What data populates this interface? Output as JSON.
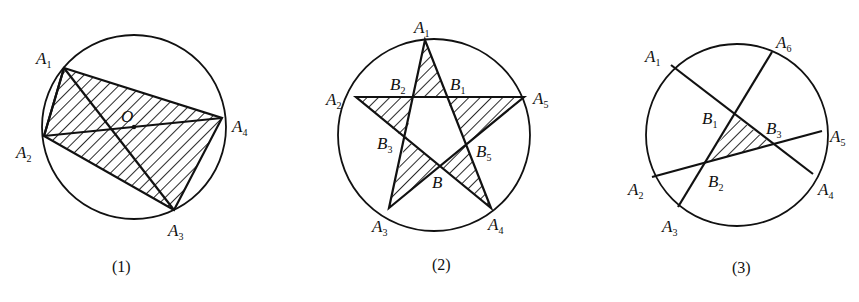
{
  "figures": [
    {
      "caption": "(1)",
      "labels": {
        "A1": "A",
        "A1s": "1",
        "A2": "A",
        "A2s": "2",
        "A3": "A",
        "A3s": "3",
        "A4": "A",
        "A4s": "4",
        "O": "O"
      }
    },
    {
      "caption": "(2)",
      "labels": {
        "A1": "A",
        "A1s": "1",
        "A2": "A",
        "A2s": "2",
        "A3": "A",
        "A3s": "3",
        "A4": "A",
        "A4s": "4",
        "A5": "A",
        "A5s": "5",
        "B1": "B",
        "B1s": "1",
        "B2": "B",
        "B2s": "2",
        "B3": "B",
        "B3s": "3",
        "B5": "B",
        "B5s": "5",
        "B": "B"
      }
    },
    {
      "caption": "(3)",
      "labels": {
        "A1": "A",
        "A1s": "1",
        "A2": "A",
        "A2s": "2",
        "A3": "A",
        "A3s": "3",
        "A4": "A",
        "A4s": "4",
        "A5": "A",
        "A5s": "5",
        "A6": "A",
        "A6s": "6",
        "B1": "B",
        "B1s": "1",
        "B2": "B",
        "B2s": "2",
        "B3": "B",
        "B3s": "3"
      }
    }
  ],
  "colors": {
    "ink": "#111111",
    "background": "#ffffff"
  }
}
